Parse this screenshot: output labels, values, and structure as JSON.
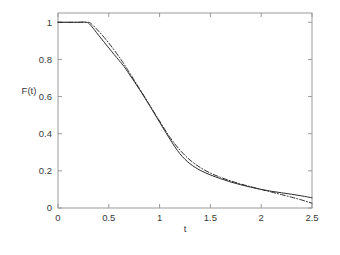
{
  "chart_data": {
    "type": "line",
    "title": "",
    "xlabel": "t",
    "ylabel": "F(t)",
    "xlim": [
      0,
      2.5
    ],
    "ylim": [
      0,
      1.05
    ],
    "grid": false,
    "legend": null,
    "xticks": [
      0,
      0.5,
      1,
      1.5,
      2,
      2.5
    ],
    "xticklabels": [
      "0",
      "0.5",
      "1",
      "1.5",
      "2",
      "2.5"
    ],
    "yticks": [
      0,
      0.2,
      0.4,
      0.6,
      0.8,
      1
    ],
    "yticklabels": [
      "0",
      "0.2",
      "0.4",
      "0.6",
      "0.8",
      "1"
    ],
    "box": true,
    "series": [
      {
        "name": "solid",
        "linestyle": "solid",
        "color": "#2b2b2b",
        "x": [
          0,
          0.1,
          0.2,
          0.28,
          0.32,
          0.4,
          0.5,
          0.6,
          0.65,
          0.7,
          0.8,
          0.9,
          1.0,
          1.1,
          1.2,
          1.3,
          1.4,
          1.5,
          1.6,
          1.7,
          1.8,
          1.9,
          2.0,
          2.1,
          2.2,
          2.3,
          2.4,
          2.5
        ],
        "y": [
          1.0,
          1.0,
          1.0,
          1.0,
          0.985,
          0.93,
          0.862,
          0.795,
          0.762,
          0.722,
          0.64,
          0.553,
          0.462,
          0.372,
          0.292,
          0.238,
          0.203,
          0.178,
          0.158,
          0.14,
          0.125,
          0.112,
          0.1,
          0.09,
          0.082,
          0.074,
          0.065,
          0.055
        ]
      },
      {
        "name": "dash-dot",
        "linestyle": "dashdot",
        "color": "#2b2b2b",
        "x": [
          0,
          0.1,
          0.2,
          0.28,
          0.32,
          0.4,
          0.5,
          0.6,
          0.65,
          0.7,
          0.8,
          0.9,
          1.0,
          1.1,
          1.2,
          1.3,
          1.4,
          1.5,
          1.6,
          1.7,
          1.8,
          1.9,
          2.0,
          2.1,
          2.2,
          2.3,
          2.4,
          2.5
        ],
        "y": [
          1.0,
          1.0,
          1.0,
          1.0,
          0.995,
          0.952,
          0.888,
          0.815,
          0.775,
          0.732,
          0.645,
          0.556,
          0.468,
          0.382,
          0.312,
          0.258,
          0.218,
          0.188,
          0.165,
          0.146,
          0.129,
          0.114,
          0.1,
          0.086,
          0.072,
          0.058,
          0.043,
          0.026
        ]
      }
    ]
  },
  "axes": {
    "x_label": "t",
    "y_label": "F(t)"
  }
}
